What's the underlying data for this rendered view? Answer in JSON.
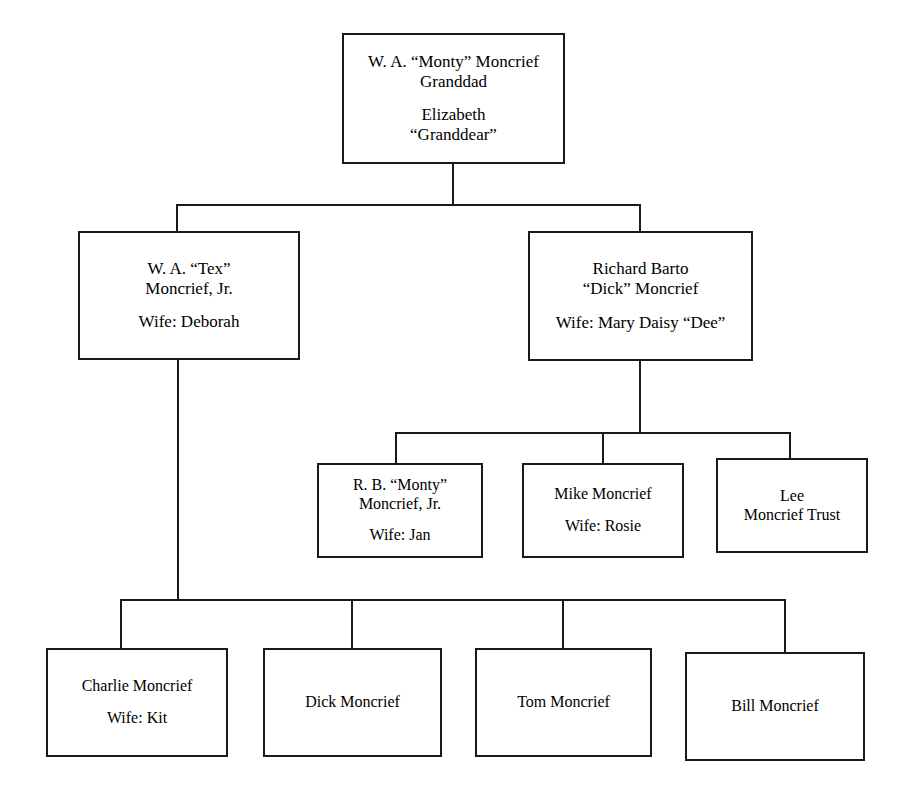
{
  "diagram": {
    "type": "family-tree-org-chart",
    "background_color": "#ffffff",
    "line_color": "#1a1a1a",
    "text_color": "#000000"
  },
  "nodes": [
    {
      "id": "monty-elizabeth",
      "name": "root-grandparents",
      "generation": 1,
      "x": 342,
      "y": 33,
      "width": 223,
      "height": 131,
      "font_size": 17,
      "groups": [
        [
          "W. A. “Monty” Moncrief",
          "Granddad"
        ],
        [
          "Elizabeth",
          "“Granddear”"
        ]
      ]
    },
    {
      "id": "tex-moncrief",
      "name": "tex-moncrief",
      "generation": 2,
      "x": 78,
      "y": 231,
      "width": 222,
      "height": 129,
      "font_size": 17,
      "groups": [
        [
          "W. A. “Tex”",
          "Moncrief, Jr."
        ],
        [
          "Wife: Deborah"
        ]
      ]
    },
    {
      "id": "dick-moncrief",
      "name": "richard-barto-dick-moncrief",
      "generation": 2,
      "x": 528,
      "y": 231,
      "width": 225,
      "height": 130,
      "font_size": 17,
      "groups": [
        [
          "Richard Barto",
          "“Dick” Moncrief"
        ],
        [
          "Wife: Mary Daisy “Dee”"
        ]
      ]
    },
    {
      "id": "rb-monty-moncrief",
      "name": "rb-monty-moncrief-jr",
      "generation": 3,
      "x": 317,
      "y": 463,
      "width": 166,
      "height": 95,
      "font_size": 16,
      "groups": [
        [
          "R. B. “Monty”",
          "Moncrief, Jr."
        ],
        [
          "Wife: Jan"
        ]
      ]
    },
    {
      "id": "mike-moncrief",
      "name": "mike-moncrief",
      "generation": 3,
      "x": 522,
      "y": 463,
      "width": 162,
      "height": 95,
      "font_size": 16,
      "groups": [
        [
          "Mike Moncrief"
        ],
        [
          "Wife: Rosie"
        ]
      ]
    },
    {
      "id": "lee-moncrief-trust",
      "name": "lee-moncrief-trust",
      "generation": 3,
      "x": 716,
      "y": 458,
      "width": 152,
      "height": 95,
      "font_size": 16,
      "groups": [
        [
          "Lee",
          "Moncrief Trust"
        ]
      ]
    },
    {
      "id": "charlie-moncrief",
      "name": "charlie-moncrief",
      "generation": 4,
      "x": 46,
      "y": 648,
      "width": 182,
      "height": 109,
      "font_size": 16,
      "groups": [
        [
          "Charlie Moncrief"
        ],
        [
          "Wife: Kit"
        ]
      ]
    },
    {
      "id": "dick-moncrief-son",
      "name": "dick-moncrief-son",
      "generation": 4,
      "x": 263,
      "y": 648,
      "width": 179,
      "height": 109,
      "font_size": 16,
      "groups": [
        [
          "Dick Moncrief"
        ]
      ]
    },
    {
      "id": "tom-moncrief",
      "name": "tom-moncrief",
      "generation": 4,
      "x": 475,
      "y": 648,
      "width": 177,
      "height": 109,
      "font_size": 16,
      "groups": [
        [
          "Tom Moncrief"
        ]
      ]
    },
    {
      "id": "bill-moncrief",
      "name": "bill-moncrief",
      "generation": 4,
      "x": 685,
      "y": 652,
      "width": 180,
      "height": 109,
      "font_size": 16,
      "groups": [
        [
          "Bill Moncrief"
        ]
      ]
    }
  ],
  "connectors": [
    {
      "name": "root-stem-down",
      "x1": 453,
      "y1": 164,
      "x2": 453,
      "y2": 205
    },
    {
      "name": "generation-2-bus",
      "x1": 176,
      "y1": 205,
      "x2": 641,
      "y2": 205
    },
    {
      "name": "drop-to-tex",
      "x1": 177,
      "y1": 205,
      "x2": 177,
      "y2": 231
    },
    {
      "name": "drop-to-dick",
      "x1": 640,
      "y1": 205,
      "x2": 640,
      "y2": 231
    },
    {
      "name": "dick-stem-down",
      "x1": 640,
      "y1": 361,
      "x2": 640,
      "y2": 433
    },
    {
      "name": "generation-3-bus",
      "x1": 395,
      "y1": 433,
      "x2": 791,
      "y2": 433
    },
    {
      "name": "drop-to-rb-monty",
      "x1": 396,
      "y1": 433,
      "x2": 396,
      "y2": 463
    },
    {
      "name": "drop-to-mike",
      "x1": 603,
      "y1": 433,
      "x2": 603,
      "y2": 463
    },
    {
      "name": "drop-to-lee-trust",
      "x1": 790,
      "y1": 433,
      "x2": 790,
      "y2": 458
    },
    {
      "name": "tex-stem-down",
      "x1": 178,
      "y1": 360,
      "x2": 178,
      "y2": 600
    },
    {
      "name": "generation-4-bus",
      "x1": 120,
      "y1": 600,
      "x2": 786,
      "y2": 600
    },
    {
      "name": "drop-to-charlie",
      "x1": 121,
      "y1": 600,
      "x2": 121,
      "y2": 648
    },
    {
      "name": "drop-to-dick-son",
      "x1": 352,
      "y1": 600,
      "x2": 352,
      "y2": 648
    },
    {
      "name": "drop-to-tom",
      "x1": 563,
      "y1": 600,
      "x2": 563,
      "y2": 648
    },
    {
      "name": "drop-to-bill",
      "x1": 785,
      "y1": 600,
      "x2": 785,
      "y2": 652
    }
  ]
}
